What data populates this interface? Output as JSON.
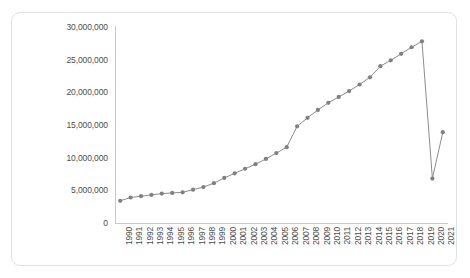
{
  "chart_data": {
    "type": "line",
    "title": "",
    "subtitle": "",
    "xlabel": "",
    "ylabel": "",
    "grid": false,
    "legend": "none",
    "marker": "circle",
    "line_color": "#7f7f7f",
    "marker_color": "#808080",
    "axis_color": "#c9c9c9",
    "label_color": "#4d4d4d",
    "ylim": [
      0,
      30000000
    ],
    "ytick_labels": [
      "30,000,000",
      "25,000,000",
      "20,000,000",
      "15,000,000",
      "10,000,000",
      "5,000,000",
      "0"
    ],
    "ytick_values": [
      30000000,
      25000000,
      20000000,
      15000000,
      10000000,
      5000000,
      0
    ],
    "categories": [
      "1990",
      "1991",
      "1992",
      "1993",
      "1994",
      "1995",
      "1996",
      "1997",
      "1998",
      "1999",
      "2000",
      "2001",
      "2002",
      "2003",
      "2004",
      "2005",
      "2006",
      "2007",
      "2008",
      "2009",
      "2010",
      "2011",
      "2012",
      "2013",
      "2014",
      "2015",
      "2016",
      "2017",
      "2018",
      "2019",
      "2020",
      "2021"
    ],
    "values": [
      3400000,
      3900000,
      4100000,
      4300000,
      4500000,
      4600000,
      4700000,
      5100000,
      5500000,
      6100000,
      6900000,
      7600000,
      8300000,
      9000000,
      9800000,
      10700000,
      11600000,
      14800000,
      16100000,
      17300000,
      18400000,
      19300000,
      20200000,
      21200000,
      22300000,
      24000000,
      24900000,
      25900000,
      26900000,
      27800000,
      6800000,
      13900000
    ]
  }
}
